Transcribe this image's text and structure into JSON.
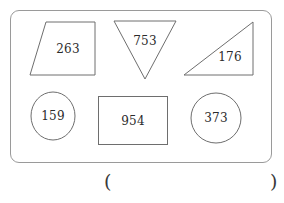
{
  "page": {
    "width": 284,
    "height": 203,
    "background_color": "#ffffff",
    "stroke_color": "#6e6e6e",
    "text_color": "#2b2b2b"
  },
  "panel": {
    "name": "shape-panel",
    "border_color": "#9a9a9a",
    "corner_radius": 9
  },
  "shapes": [
    {
      "id": "trapezoid",
      "kind": "trapezoid",
      "label": "263",
      "row": "top",
      "position": 1
    },
    {
      "id": "triangle-down",
      "kind": "inverted-triangle",
      "label": "753",
      "row": "top",
      "position": 2
    },
    {
      "id": "right-triangle",
      "kind": "right-triangle",
      "label": "176",
      "row": "top",
      "position": 3
    },
    {
      "id": "circle-left",
      "kind": "circle",
      "label": "159",
      "row": "bottom",
      "position": 1
    },
    {
      "id": "rectangle",
      "kind": "rectangle",
      "label": "954",
      "row": "bottom",
      "position": 2
    },
    {
      "id": "circle-right",
      "kind": "circle",
      "label": "373",
      "row": "bottom",
      "position": 3
    }
  ],
  "answer": {
    "open_paren": "(",
    "close_paren": ")",
    "value": ""
  }
}
